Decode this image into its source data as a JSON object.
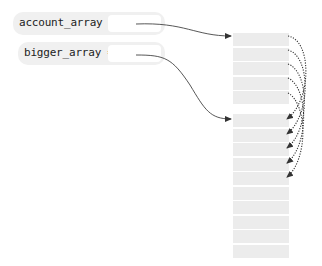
{
  "variables": [
    {
      "name": "account_array",
      "label": "account_array =",
      "points_to": "small_array"
    },
    {
      "name": "bigger_array",
      "label": "bigger_array =",
      "points_to": "big_array"
    }
  ],
  "arrays": {
    "small_array": {
      "cell_count": 5
    },
    "big_array": {
      "cell_count": 10
    }
  },
  "copy_arrows": {
    "count": 5,
    "style": "dotted",
    "from": "small_array",
    "to": "big_array"
  },
  "colors": {
    "pill_bg": "#f0f0f0",
    "cell_bg": "#ececec",
    "arrow": "#333333"
  }
}
